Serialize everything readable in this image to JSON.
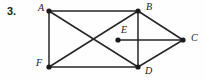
{
  "figure": {
    "problem_number": "3.",
    "caption": "",
    "stroke_color": "#262626",
    "vertex_color": "#1a1a1a",
    "background_color": "#fefefe",
    "line_width": 1.5,
    "vertex_radius": 2.6,
    "vertices": [
      {
        "id": "A",
        "label": "A",
        "x": 49,
        "y": 11,
        "label_x": 38,
        "label_y": 3
      },
      {
        "id": "B",
        "label": "B",
        "x": 138,
        "y": 11,
        "label_x": 146,
        "label_y": 2
      },
      {
        "id": "C",
        "label": "C",
        "x": 183,
        "y": 40,
        "label_x": 191,
        "label_y": 33
      },
      {
        "id": "D",
        "label": "D",
        "x": 138,
        "y": 67,
        "label_x": 145,
        "label_y": 66
      },
      {
        "id": "E",
        "label": "E",
        "x": 118,
        "y": 40,
        "label_x": 121,
        "label_y": 25
      },
      {
        "id": "F",
        "label": "F",
        "x": 49,
        "y": 67,
        "label_x": 36,
        "label_y": 58
      }
    ],
    "edges": [
      {
        "from": "A",
        "to": "B",
        "name": "edge-a-b"
      },
      {
        "from": "A",
        "to": "F",
        "name": "edge-a-f"
      },
      {
        "from": "A",
        "to": "D",
        "name": "edge-a-d"
      },
      {
        "from": "F",
        "to": "B",
        "name": "edge-f-b"
      },
      {
        "from": "F",
        "to": "D",
        "name": "edge-f-d"
      },
      {
        "from": "B",
        "to": "D",
        "name": "edge-b-d"
      },
      {
        "from": "B",
        "to": "C",
        "name": "edge-b-c"
      },
      {
        "from": "D",
        "to": "C",
        "name": "edge-d-c"
      },
      {
        "from": "E",
        "to": "C",
        "name": "edge-e-c"
      }
    ]
  }
}
